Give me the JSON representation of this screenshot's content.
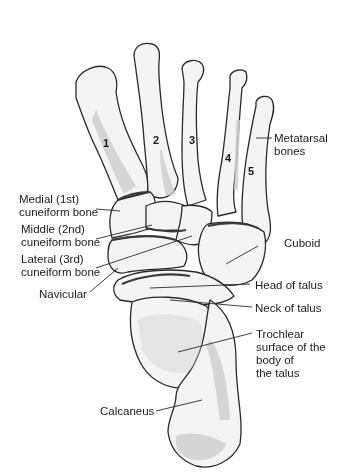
{
  "figure": {
    "colors": {
      "outline": "#2a2a2a",
      "bone": "#f4f4f4",
      "shade": "#cfcfcf",
      "joint": "#3a3a3a",
      "text": "#1a1a1a"
    },
    "metatarsal_numbers": [
      "1",
      "2",
      "3",
      "4",
      "5"
    ],
    "labels": {
      "metatarsal_line1": "Metatarsal",
      "metatarsal_line2": "bones",
      "medial_line1": "Medial (1st)",
      "medial_line2": "cuneiform bone",
      "middle_line1": "Middle (2nd)",
      "middle_line2": "cuneiform bone",
      "lateral_line1": "Lateral (3rd)",
      "lateral_line2": "cuneiform bone",
      "navicular": "Navicular",
      "cuboid": "Cuboid",
      "head_of_talus": "Head of talus",
      "neck_of_talus": "Neck of talus",
      "trochlear_line1": "Trochlear",
      "trochlear_line2": "surface of the",
      "trochlear_line3": "body of",
      "trochlear_line4": "the talus",
      "calcaneus": "Calcaneus"
    }
  }
}
